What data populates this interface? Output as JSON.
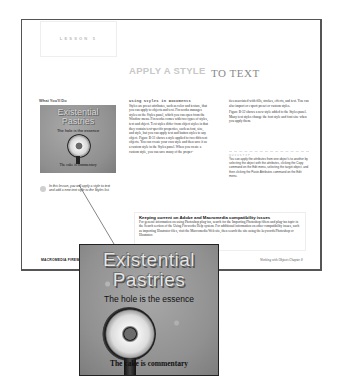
{
  "lesson": {
    "label": "LESSON 5"
  },
  "title": {
    "part1": "APPLY A STYLE",
    "part2": "TO TEXT"
  },
  "sidebar": {
    "heading": "What You'll Do",
    "thumbnail": {
      "line1": "Existential",
      "line2": "Pastries",
      "subtitle": "The hole is the essence",
      "footer": "The cake is commentary"
    },
    "caption": "In this lesson, you will apply a style to text and add a new text style to the Styles list."
  },
  "column1": {
    "heading": "Using Styles in Documents",
    "body": "Styles are preset attributes, such as color and texture, that you can apply to objects and text. Fireworks manages styles on the Styles panel, which you can open from the Window menu. Fireworks comes with two types of styles, text and object. Text styles differ from object styles in that they contain text-specific properties, such as font, size, and style, but you can apply text and button styles to any object. Figure B-31 shows a style applied to two different objects. You can create your own style and then save it as a custom style in the Styles panel. When you create a custom style, you can save many of the proper-"
  },
  "column2": {
    "p1": "ties associated with fills, strokes, effects, and text. You can also import or export preset or custom styles.",
    "p2": "Figure B-32 shows a new style added to the Styles panel. Many text styles change the font style and font size when you apply them.",
    "note": {
      "heading": "QUICKTIP",
      "body": "You can apply the attributes from one object's to another by selecting the object with the attributes, clicking the Copy command on the Edit menu, selecting the target object, and then clicking the Paste Attributes command on the Edit menu."
    }
  },
  "tip_box": {
    "title": "Keeping current on Adobe and Macromedia compatibility issues",
    "body": "For general information on using Photoshop plug-ins, search for the Importing Photoshop filters and plug-ins topic in the Search section of the Using Fireworks Help system. For additional information on other compatibility issues, such as importing Illustrator files, visit the Macromedia Web site, then search the site using the keywords Photoshop or Illustrator."
  },
  "footer": {
    "left": "MACROMEDIA FIREWORKS MX",
    "right": "Working with Objects   Chapter 8"
  },
  "magnified_image": {
    "line1": "Existential",
    "line2": "Pastries",
    "subtitle": "The hole is the essence",
    "footer": "The cake is commentary"
  }
}
